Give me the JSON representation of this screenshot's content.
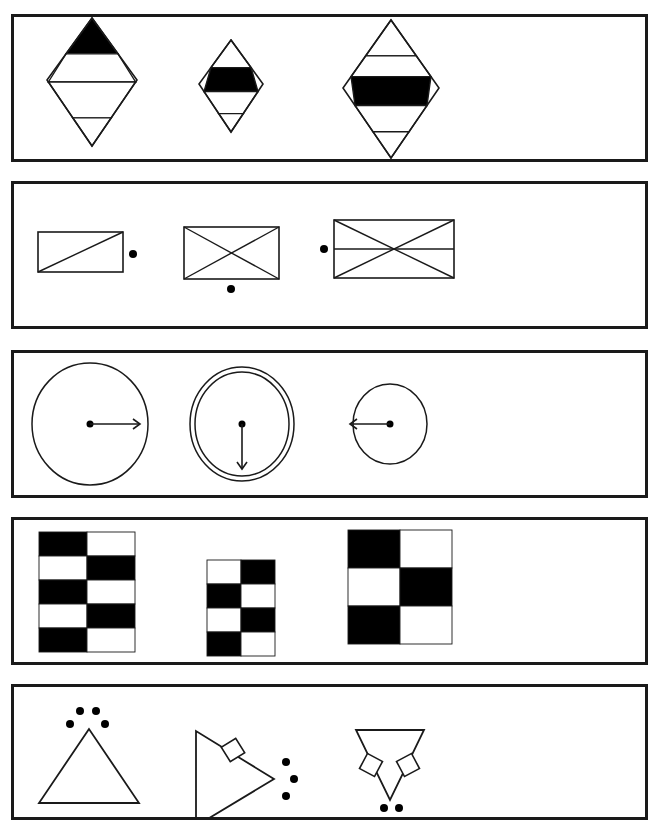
{
  "sheet": {
    "width": 659,
    "height": 827,
    "background": "#ffffff",
    "ink": "#1a1a1a",
    "fill_black": "#000000",
    "fill_white": "#ffffff",
    "border_width": 3,
    "panel_left": 11,
    "panel_width": 637,
    "description": "Five bordered panels, each containing three abstract line-drawing figures"
  },
  "panels": [
    {
      "id": "panel-diamonds",
      "name": "diamond-banded-figures",
      "top": 14,
      "height": 148,
      "figures": [
        {
          "name": "diamond-figure-1",
          "cx": 92,
          "top": 18,
          "half_w": 45,
          "upper_h": 62,
          "lower_h": 66,
          "bands": [
            {
              "t": 0.0,
              "b": 0.28,
              "fill": "#000000"
            },
            {
              "t": 0.28,
              "b": 0.5,
              "fill": "#ffffff"
            },
            {
              "t": 0.5,
              "b": 0.78,
              "fill": "#ffffff"
            },
            {
              "t": 0.78,
              "b": 1.0,
              "fill": "#ffffff"
            }
          ]
        },
        {
          "name": "diamond-figure-2",
          "cx": 231,
          "top": 40,
          "half_w": 32,
          "upper_h": 44,
          "lower_h": 48,
          "bands": [
            {
              "t": 0.0,
              "b": 0.3,
              "fill": "#ffffff"
            },
            {
              "t": 0.3,
              "b": 0.56,
              "fill": "#000000"
            },
            {
              "t": 0.56,
              "b": 0.8,
              "fill": "#ffffff"
            },
            {
              "t": 0.8,
              "b": 1.0,
              "fill": "#ffffff"
            }
          ]
        },
        {
          "name": "diamond-figure-3",
          "cx": 391,
          "top": 20,
          "half_w": 48,
          "upper_h": 68,
          "lower_h": 70,
          "bands": [
            {
              "t": 0.0,
              "b": 0.26,
              "fill": "#ffffff"
            },
            {
              "t": 0.26,
              "b": 0.41,
              "fill": "#ffffff"
            },
            {
              "t": 0.41,
              "b": 0.62,
              "fill": "#000000"
            },
            {
              "t": 0.62,
              "b": 0.81,
              "fill": "#ffffff"
            },
            {
              "t": 0.81,
              "b": 1.0,
              "fill": "#ffffff"
            }
          ]
        }
      ]
    },
    {
      "id": "panel-rectangles",
      "name": "rectangle-diagonal-figures",
      "top": 181,
      "height": 148,
      "figures": [
        {
          "name": "rectangle-figure-1",
          "x": 38,
          "y": 232,
          "w": 85,
          "h": 40,
          "diagonals": [
            "bl-tr"
          ],
          "midline": false,
          "dots": [
            {
              "name": "dot-right",
              "cx": 133,
              "cy": 254,
              "r": 4
            }
          ]
        },
        {
          "name": "rectangle-figure-2",
          "x": 184,
          "y": 227,
          "w": 95,
          "h": 52,
          "diagonals": [
            "bl-tr",
            "tl-br"
          ],
          "midline": false,
          "dots": [
            {
              "name": "dot-below",
              "cx": 231,
              "cy": 289,
              "r": 4
            }
          ]
        },
        {
          "name": "rectangle-figure-3",
          "x": 334,
          "y": 220,
          "w": 120,
          "h": 58,
          "diagonals": [
            "bl-tr",
            "tl-br"
          ],
          "midline": true,
          "dots": [
            {
              "name": "dot-left",
              "cx": 324,
              "cy": 249,
              "r": 4
            }
          ]
        }
      ]
    },
    {
      "id": "panel-circles",
      "name": "circle-arrow-figures",
      "top": 350,
      "height": 148,
      "figures": [
        {
          "name": "circle-figure-1",
          "cx": 90,
          "cy": 424,
          "rx": 58,
          "ry": 61,
          "rings": 1,
          "dot": {
            "cx": 90,
            "cy": 424,
            "r": 3.5
          },
          "arrow": {
            "direction": "right",
            "length": 50
          }
        },
        {
          "name": "circle-figure-2",
          "cx": 242,
          "cy": 424,
          "rx": 47,
          "ry": 52,
          "rings": 2,
          "ring_gap": 5,
          "dot": {
            "cx": 242,
            "cy": 424,
            "r": 3.5
          },
          "arrow": {
            "direction": "down",
            "length": 45
          }
        },
        {
          "name": "circle-figure-3",
          "cx": 390,
          "cy": 424,
          "rx": 37,
          "ry": 40,
          "rings": 1,
          "dot": {
            "cx": 390,
            "cy": 424,
            "r": 3.5
          },
          "arrow": {
            "direction": "left",
            "length": 40
          }
        }
      ]
    },
    {
      "id": "panel-checkerboards",
      "name": "checkerboard-figures",
      "top": 517,
      "height": 148,
      "figures": [
        {
          "name": "checkerboard-figure-1",
          "x": 39,
          "y": 532,
          "cols": 2,
          "rows": 5,
          "cell_w": 48,
          "cell_h": 24,
          "start": "black"
        },
        {
          "name": "checkerboard-figure-2",
          "x": 207,
          "y": 560,
          "cols": 2,
          "rows": 4,
          "cell_w": 34,
          "cell_h": 24,
          "start": "white"
        },
        {
          "name": "checkerboard-figure-3",
          "x": 348,
          "y": 530,
          "cols": 2,
          "rows": 3,
          "cell_w": 52,
          "cell_h": 38,
          "start": "black"
        }
      ]
    },
    {
      "id": "panel-triangles",
      "name": "triangle-dot-figures",
      "top": 684,
      "height": 136,
      "figures": [
        {
          "name": "triangle-figure-1",
          "orientation": "up",
          "points": "89,729 39,803 139,803",
          "dots": [
            {
              "name": "dot-upper-left",
              "cx": 80,
              "cy": 711,
              "r": 4
            },
            {
              "name": "dot-upper-right",
              "cx": 96,
              "cy": 711,
              "r": 4
            },
            {
              "name": "dot-lower-left",
              "cx": 70,
              "cy": 724,
              "r": 4
            },
            {
              "name": "dot-lower-right",
              "cx": 105,
              "cy": 724,
              "r": 4
            }
          ],
          "squares": []
        },
        {
          "name": "triangle-figure-2",
          "orientation": "right",
          "points": "196,731 196,826 274,779",
          "dots": [
            {
              "name": "dot-top",
              "cx": 286,
              "cy": 762,
              "r": 4
            },
            {
              "name": "dot-middle",
              "cx": 294,
              "cy": 779,
              "r": 4
            },
            {
              "name": "dot-bottom",
              "cx": 286,
              "cy": 796,
              "r": 4
            }
          ],
          "squares": [
            {
              "name": "square-upper-edge",
              "cx": 233,
              "cy": 750,
              "size": 17,
              "rotate": -32
            }
          ]
        },
        {
          "name": "triangle-figure-3",
          "orientation": "down",
          "points": "356,730 424,730 390,800",
          "dots": [
            {
              "name": "dot-below-left",
              "cx": 384,
              "cy": 808,
              "r": 4
            },
            {
              "name": "dot-below-right",
              "cx": 399,
              "cy": 808,
              "r": 4
            }
          ],
          "squares": [
            {
              "name": "square-left-edge",
              "cx": 371,
              "cy": 765,
              "size": 17,
              "rotate": 28
            },
            {
              "name": "square-right-edge",
              "cx": 408,
              "cy": 765,
              "size": 17,
              "rotate": -28
            }
          ]
        }
      ]
    }
  ]
}
